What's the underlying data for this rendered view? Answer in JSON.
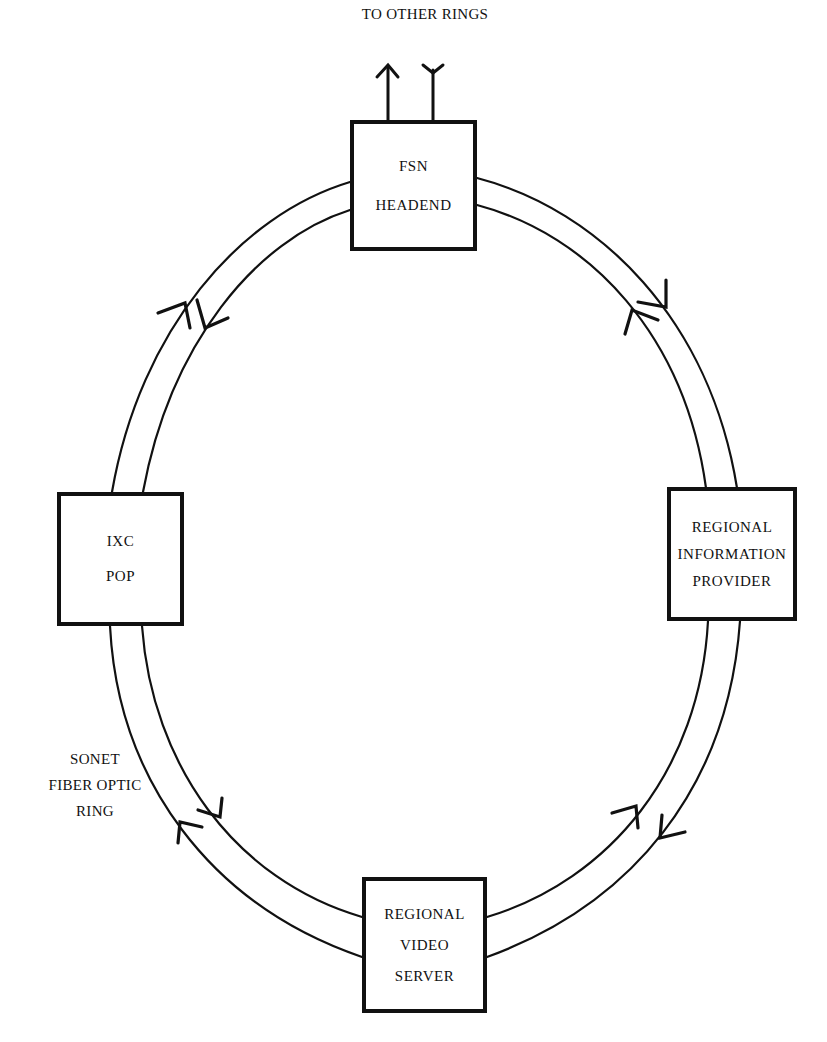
{
  "diagram": {
    "type": "ring-network",
    "title": "",
    "top_label": "TO OTHER RINGS",
    "ring_label": [
      "SONET",
      "FIBER OPTIC",
      "RING"
    ],
    "nodes": {
      "fsn": {
        "lines": [
          "FSN",
          "HEADEND"
        ],
        "position": "top"
      },
      "rip": {
        "lines": [
          "REGIONAL",
          "INFORMATION",
          "PROVIDER"
        ],
        "position": "right"
      },
      "rvs": {
        "lines": [
          "REGIONAL",
          "VIDEO",
          "SERVER"
        ],
        "position": "bottom"
      },
      "ixc": {
        "lines": [
          "IXC",
          "POP"
        ],
        "position": "left"
      }
    },
    "edges": [
      {
        "from": "FSN HEADEND",
        "to": "REGIONAL INFORMATION PROVIDER",
        "direction": "bidirectional"
      },
      {
        "from": "REGIONAL INFORMATION PROVIDER",
        "to": "REGIONAL VIDEO SERVER",
        "direction": "bidirectional"
      },
      {
        "from": "REGIONAL VIDEO SERVER",
        "to": "IXC POP",
        "direction": "bidirectional"
      },
      {
        "from": "IXC POP",
        "to": "FSN HEADEND",
        "direction": "bidirectional"
      },
      {
        "from": "FSN HEADEND",
        "to": "OTHER RINGS",
        "direction": "outgoing/incoming pair"
      }
    ],
    "colors": {
      "line": "#111111",
      "background": "#ffffff"
    }
  }
}
